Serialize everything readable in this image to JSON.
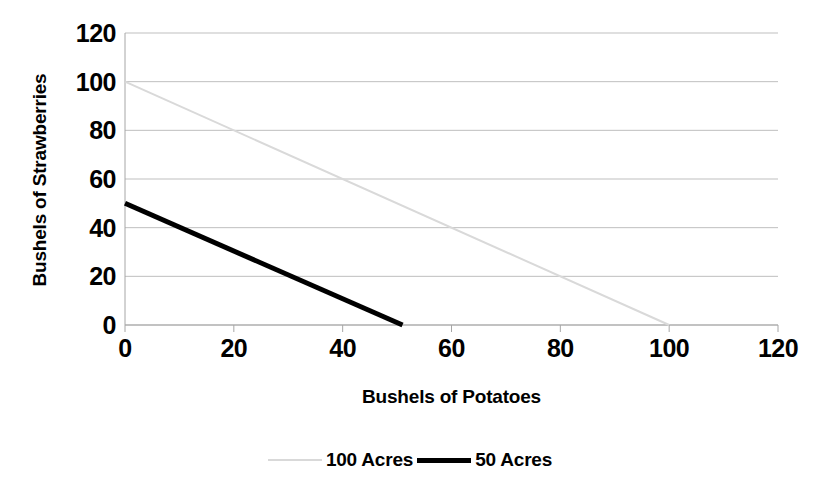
{
  "chart_data": {
    "type": "line",
    "title": "",
    "xlabel": "Bushels of Potatoes",
    "ylabel": "Bushels of Strawberries",
    "xlim": [
      0,
      120
    ],
    "ylim": [
      0,
      120
    ],
    "xticks": [
      0,
      20,
      40,
      60,
      80,
      100,
      120
    ],
    "yticks": [
      0,
      20,
      40,
      60,
      80,
      100,
      120
    ],
    "xtick_labels": [
      "0",
      "20",
      "40",
      "60",
      "80",
      "100",
      "120"
    ],
    "ytick_labels": [
      "0",
      "20",
      "40",
      "60",
      "80",
      "100",
      "120"
    ],
    "grid": "horizontal",
    "legend_position": "bottom",
    "series": [
      {
        "name": "100 Acres",
        "color": "#d9d9d9",
        "width": 2,
        "x": [
          0,
          100
        ],
        "y": [
          100,
          0
        ]
      },
      {
        "name": "50 Acres",
        "color": "#000000",
        "width": 5,
        "x": [
          0,
          51
        ],
        "y": [
          50,
          0
        ]
      }
    ],
    "colors": {
      "axis": "#a6a6a6",
      "grid": "#bfbfbf",
      "series_100_acres": "#d9d9d9",
      "series_50_acres": "#000000",
      "text": "#000000",
      "background": "#ffffff"
    }
  },
  "legend": {
    "entries": [
      {
        "label": "100 Acres"
      },
      {
        "label": "50 Acres"
      }
    ]
  },
  "axes": {
    "x_title": "Bushels of Potatoes",
    "y_title": "Bushels of Strawberries"
  }
}
